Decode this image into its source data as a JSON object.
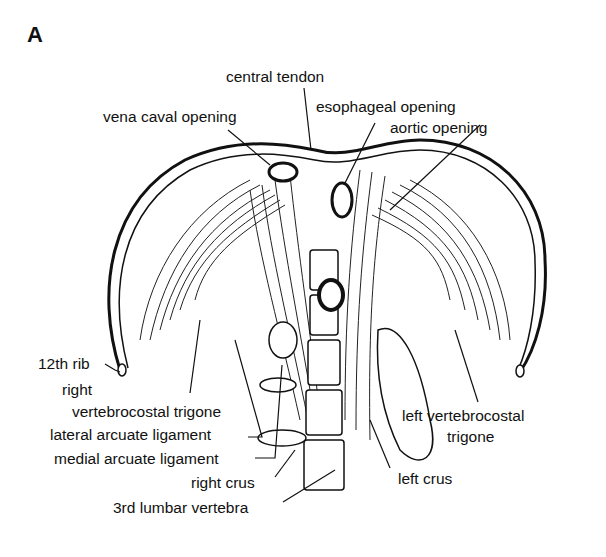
{
  "figure": {
    "panel_letter": "A",
    "labels": {
      "central_tendon": "central tendon",
      "vena_caval_opening": "vena caval opening",
      "esophageal_opening": "esophageal opening",
      "aortic_opening": "aortic opening",
      "twelfth_rib": "12th rib",
      "right_vertebrocostal_trigone_line1": "right",
      "right_vertebrocostal_trigone_line2": "vertebrocostal trigone",
      "lateral_arcuate_ligament": "lateral arcuate ligament",
      "medial_arcuate_ligament": "medial arcuate ligament",
      "right_crus": "right crus",
      "third_lumbar_vertebra": "3rd lumbar vertebra",
      "left_vertebrocostal_trigone_line1": "left vertebrocostal",
      "left_vertebrocostal_trigone_line2": "trigone",
      "left_crus": "left crus"
    }
  }
}
